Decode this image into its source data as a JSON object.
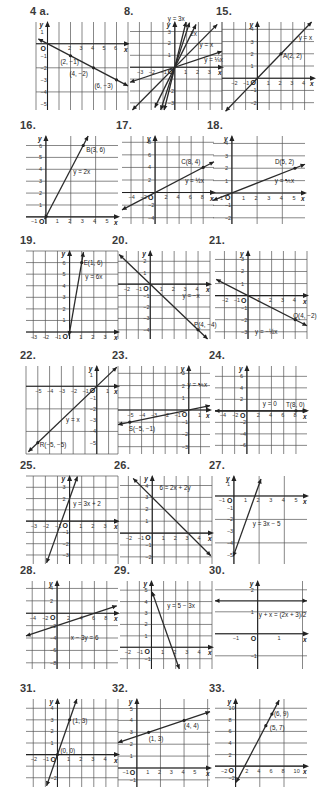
{
  "page": {
    "background": "#ffffff",
    "ink_color": "#2a2a2a"
  },
  "chart_data": [
    {
      "id": "4a",
      "label": "4 a.",
      "type": "line",
      "x_ticks": [
        2,
        3,
        4,
        5,
        6
      ],
      "y_ticks": [
        1,
        -1,
        -2,
        -3,
        -4,
        -5
      ],
      "xlim": [
        -1,
        7
      ],
      "ylim": [
        -5.5,
        1.8
      ],
      "xlabel": "x",
      "ylabel": "y",
      "series": [
        {
          "name": "line",
          "slope": -0.5,
          "intercept": 0,
          "x_range": [
            -0.8,
            7
          ]
        }
      ],
      "points": [
        {
          "x": 2,
          "y": -1,
          "label": "(2, −1)",
          "dx": -10,
          "dy": 8
        },
        {
          "x": 4,
          "y": -2,
          "label": "(4, −2)",
          "dx": -24,
          "dy": 8
        },
        {
          "x": 6,
          "y": -3,
          "label": "(6, −3)",
          "dx": -22,
          "dy": 8
        }
      ],
      "labels": [],
      "pos": [
        36,
        8
      ]
    },
    {
      "id": "8",
      "label": "8.",
      "type": "line",
      "x_ticks": [
        -3,
        -2,
        -1,
        1,
        2,
        3
      ],
      "y_ticks": [
        3,
        2,
        1,
        -2,
        -3
      ],
      "xlim": [
        -3.8,
        4
      ],
      "ylim": [
        -3.6,
        3.8
      ],
      "xlabel": "x",
      "ylabel": "y",
      "series": [
        {
          "name": "y = 3x",
          "slope": 3,
          "intercept": 0,
          "x_range": [
            -1.2,
            1.25
          ]
        },
        {
          "name": "y = 2x",
          "slope": 2,
          "intercept": 0,
          "x_range": [
            -1.7,
            1.8
          ]
        },
        {
          "name": "y = x",
          "slope": 1,
          "intercept": 0,
          "x_range": [
            -3.6,
            3.6
          ]
        },
        {
          "name": "y = 1/3 x",
          "slope": 0.3333,
          "intercept": 0,
          "x_range": [
            -3.8,
            4
          ]
        },
        {
          "name": "y = 4x",
          "slope": 4,
          "intercept": 0,
          "x_range": [
            -0.9,
            0.95
          ]
        }
      ],
      "points": [],
      "labels": [
        {
          "text": "y = 3x",
          "x": -0.6,
          "y": 3.9
        },
        {
          "text": "2x",
          "x": 1.3,
          "y": 2.6
        },
        {
          "text": "y = x",
          "x": 2.1,
          "y": 1.7
        },
        {
          "text": "y = ⅓x",
          "x": 2.5,
          "y": 0.4
        }
      ],
      "pos": [
        130,
        8
      ]
    },
    {
      "id": "15",
      "label": "15.",
      "type": "line",
      "x_ticks": [
        -2,
        -1,
        1,
        2,
        3,
        4
      ],
      "y_ticks": [
        4,
        3,
        2,
        1,
        -1,
        -2
      ],
      "xlim": [
        -3,
        4.8
      ],
      "ylim": [
        -2.6,
        4.6
      ],
      "xlabel": "x",
      "ylabel": "y",
      "series": [
        {
          "name": "y = x",
          "slope": 1,
          "intercept": 0,
          "x_range": [
            -2.7,
            4.6
          ]
        }
      ],
      "points": [
        {
          "x": 2,
          "y": 2,
          "label": "A(2, 2)",
          "dx": 2,
          "dy": 4
        }
      ],
      "labels": [
        {
          "text": "y = x",
          "x": 3.5,
          "y": 3.1
        }
      ],
      "pos": [
        222,
        8
      ]
    },
    {
      "id": "16",
      "label": "16.",
      "type": "line",
      "x_ticks": [
        -1,
        1,
        2,
        3,
        4,
        5
      ],
      "y_ticks": [
        6,
        5,
        4,
        3,
        2,
        1
      ],
      "xlim": [
        -1.6,
        5.8
      ],
      "ylim": [
        -0.6,
        6.8
      ],
      "xlabel": "x",
      "ylabel": "y",
      "series": [
        {
          "name": "y = 2x",
          "slope": 2,
          "intercept": 0,
          "x_range": [
            -0.1,
            3.4
          ]
        }
      ],
      "points": [
        {
          "x": 3,
          "y": 6,
          "label": "B(3, 6)",
          "dx": 3,
          "dy": 6
        }
      ],
      "labels": [
        {
          "text": "y = 2x",
          "x": 2.2,
          "y": 3.6
        }
      ],
      "pos": [
        26,
        122
      ]
    },
    {
      "id": "17",
      "label": "17.",
      "type": "line",
      "x_ticks": [
        -4,
        -2,
        2,
        4,
        6,
        8
      ],
      "y_ticks": [
        8,
        6,
        4,
        2,
        -2,
        -4
      ],
      "xlim": [
        -5.5,
        9.8
      ],
      "ylim": [
        -5,
        9
      ],
      "xlabel": "x",
      "ylabel": "y",
      "series": [
        {
          "name": "y = 1/2 x",
          "slope": 0.5,
          "intercept": 0,
          "x_range": [
            -5.5,
            9.8
          ]
        }
      ],
      "points": [
        {
          "x": 8,
          "y": 4,
          "label": "C(8, 4)",
          "dx": -22,
          "dy": -3
        }
      ],
      "labels": [
        {
          "text": "y = ½x",
          "x": 5,
          "y": 1.6
        }
      ],
      "pos": [
        122,
        122
      ]
    },
    {
      "id": "18",
      "label": "18.",
      "type": "line",
      "x_ticks": [
        -1,
        1,
        2,
        3,
        4,
        5
      ],
      "y_ticks": [
        4,
        3,
        2,
        1,
        -1,
        -2
      ],
      "xlim": [
        -1.5,
        5.8
      ],
      "ylim": [
        -2.5,
        4.6
      ],
      "xlabel": "x",
      "ylabel": "y",
      "series": [
        {
          "name": "y = 2/5 x",
          "slope": 0.4,
          "intercept": 0,
          "x_range": [
            -1.5,
            5.8
          ]
        }
      ],
      "points": [
        {
          "x": 5,
          "y": 2,
          "label": "D(5, 2)",
          "dx": -20,
          "dy": -4
        }
      ],
      "labels": [
        {
          "text": "y = ⅖x",
          "x": 3.4,
          "y": 0.8
        }
      ],
      "pos": [
        213,
        122
      ]
    },
    {
      "id": "19",
      "label": "19.",
      "type": "line",
      "x_ticks": [
        -3,
        -2,
        -1,
        1,
        2,
        3
      ],
      "y_ticks": [
        6,
        5,
        4,
        3,
        2,
        1
      ],
      "xlim": [
        -3.6,
        4
      ],
      "ylim": [
        -0.6,
        7
      ],
      "xlabel": "x",
      "ylabel": "y",
      "series": [
        {
          "name": "y = 6x",
          "slope": 6,
          "intercept": 0,
          "x_range": [
            -0.05,
            1.15
          ]
        }
      ],
      "points": [
        {
          "x": 1,
          "y": 6,
          "label": "E(1, 6)",
          "dx": 2,
          "dy": 2
        }
      ],
      "labels": [
        {
          "text": "y = 6x",
          "x": 1.3,
          "y": 4.6
        }
      ],
      "pos": [
        26,
        237
      ]
    },
    {
      "id": "20",
      "label": "20.",
      "type": "line",
      "x_ticks": [
        -2,
        -1,
        1,
        2,
        3,
        4
      ],
      "y_ticks": [
        2,
        1,
        -1,
        -2,
        -3,
        -4
      ],
      "xlim": [
        -2.7,
        5
      ],
      "ylim": [
        -4.8,
        2.9
      ],
      "xlabel": "x",
      "ylabel": "y",
      "series": [
        {
          "name": "y = −x",
          "slope": -1,
          "intercept": 0,
          "x_range": [
            -2.6,
            4.8
          ]
        }
      ],
      "points": [
        {
          "x": 4,
          "y": -4,
          "label": "P(4, −4)",
          "dx": -4,
          "dy": -3
        }
      ],
      "labels": [
        {
          "text": "y = −x",
          "x": 2.7,
          "y": -1.2
        }
      ],
      "pos": [
        118,
        237
      ]
    },
    {
      "id": "21",
      "label": "21.",
      "type": "line",
      "x_ticks": [
        -2,
        -1,
        1,
        2,
        3,
        4
      ],
      "y_ticks": [
        3,
        2,
        1,
        -1,
        -2,
        -3
      ],
      "xlim": [
        -2.8,
        5
      ],
      "ylim": [
        -3.6,
        3.7
      ],
      "xlabel": "x",
      "ylabel": "y",
      "series": [
        {
          "name": "y = −1/2 x",
          "slope": -0.5,
          "intercept": 0,
          "x_range": [
            -2.7,
            5
          ]
        }
      ],
      "points": [
        {
          "x": 4,
          "y": -2,
          "label": "Q(4, −2)",
          "dx": -2,
          "dy": -2
        }
      ],
      "labels": [
        {
          "text": "y = −½x",
          "x": 0.6,
          "y": -3.2
        }
      ],
      "pos": [
        215,
        237
      ]
    },
    {
      "id": "22",
      "label": "22.",
      "type": "line",
      "x_ticks": [
        -5,
        -4,
        -3,
        -2,
        -1,
        1
      ],
      "y_ticks": [
        1,
        -1,
        -2,
        -3,
        -4,
        -5
      ],
      "xlim": [
        -6,
        1.8
      ],
      "ylim": [
        -6,
        1.8
      ],
      "xlabel": "x",
      "ylabel": "y",
      "series": [
        {
          "name": "y = x",
          "slope": 1,
          "intercept": 0,
          "x_range": [
            -5.8,
            1.7
          ]
        }
      ],
      "points": [
        {
          "x": -5,
          "y": -5,
          "label": "R(−5, −5)",
          "dx": 2,
          "dy": 4
        }
      ],
      "labels": [
        {
          "text": "y = x",
          "x": -2.6,
          "y": -3.2
        }
      ],
      "pos": [
        26,
        352
      ]
    },
    {
      "id": "23",
      "label": "23.",
      "type": "line",
      "x_ticks": [
        -5,
        -4,
        -3,
        -2,
        -1,
        1
      ],
      "y_ticks": [
        3,
        2,
        1,
        -1,
        -2,
        -3
      ],
      "xlim": [
        -6,
        1.8
      ],
      "ylim": [
        -3.6,
        3.6
      ],
      "xlabel": "x",
      "ylabel": "y",
      "series": [
        {
          "name": "y = 1/5 x",
          "slope": 0.2,
          "intercept": 0,
          "x_range": [
            -6,
            1.8
          ]
        }
      ],
      "points": [
        {
          "x": -5,
          "y": -1,
          "label": "S(−5, −1)",
          "dx": -1,
          "dy": 9
        }
      ],
      "labels": [
        {
          "text": "y = ⅕x",
          "x": -0.1,
          "y": 1.9
        }
      ],
      "pos": [
        118,
        352
      ]
    },
    {
      "id": "24",
      "label": "24.",
      "type": "line",
      "x_ticks": [
        -4,
        -2,
        2,
        4,
        6,
        8
      ],
      "y_ticks": [
        6,
        4,
        2,
        -2,
        -4,
        -6
      ],
      "xlim": [
        -5.2,
        9.8
      ],
      "ylim": [
        -7.5,
        7.8
      ],
      "xlabel": "x",
      "ylabel": "y",
      "series": [
        {
          "name": "y = 0",
          "slope": 0,
          "intercept": 0,
          "x_range": [
            -5.2,
            9.8
          ]
        }
      ],
      "points": [
        {
          "x": 8,
          "y": 0,
          "label": "T(8, 0)",
          "dx": -10,
          "dy": -4
        }
      ],
      "labels": [
        {
          "text": "y = 0",
          "x": 2.6,
          "y": 0.9
        }
      ],
      "pos": [
        215,
        352
      ]
    },
    {
      "id": "25",
      "label": "25.",
      "type": "line",
      "x_ticks": [
        -3,
        -2,
        -1,
        1,
        2,
        3
      ],
      "y_ticks": [
        3,
        2,
        -1,
        -2,
        -3
      ],
      "xlim": [
        -3.6,
        4
      ],
      "ylim": [
        -3.8,
        4
      ],
      "xlabel": "x",
      "ylabel": "y",
      "series": [
        {
          "name": "y = 3x + 2",
          "slope": 3,
          "intercept": 2,
          "x_range": [
            -1.9,
            0.65
          ]
        }
      ],
      "points": [],
      "labels": [
        {
          "text": "y = 3x + 2",
          "x": 0.3,
          "y": 1.3
        }
      ],
      "pos": [
        26,
        462
      ]
    },
    {
      "id": "26",
      "label": "26.",
      "type": "line",
      "x_ticks": [
        -2,
        -1,
        1,
        2,
        3,
        4
      ],
      "y_ticks": [
        4,
        3,
        2,
        1,
        -1,
        -2
      ],
      "xlim": [
        -2.7,
        5
      ],
      "ylim": [
        -2.6,
        4.8
      ],
      "xlabel": "x",
      "ylabel": "y",
      "series": [
        {
          "name": "6 = 2x + 2y",
          "slope": -1,
          "intercept": 3,
          "x_range": [
            -1.6,
            4.9
          ]
        }
      ],
      "points": [],
      "labels": [
        {
          "text": "6 = 2x + 2y",
          "x": 0.6,
          "y": 3.6
        }
      ],
      "pos": [
        120,
        462
      ]
    },
    {
      "id": "27",
      "label": "27.",
      "type": "line",
      "x_ticks": [
        -1,
        1,
        2,
        3,
        4,
        5
      ],
      "y_ticks": [
        1,
        -1,
        -2,
        -3,
        -4,
        -5
      ],
      "xlim": [
        -1.5,
        5.8
      ],
      "ylim": [
        -5.8,
        1.7
      ],
      "xlabel": "x",
      "ylabel": "y",
      "series": [
        {
          "name": "y = 3x − 5",
          "slope": 3,
          "intercept": -5,
          "x_range": [
            -0.05,
            2.15
          ]
        }
      ],
      "points": [],
      "labels": [
        {
          "text": "y = 3x − 5",
          "x": 1.5,
          "y": -2.6
        }
      ],
      "pos": [
        215,
        462
      ]
    },
    {
      "id": "28",
      "label": "28.",
      "type": "line",
      "x_ticks": [
        -4,
        -2,
        2,
        4,
        6,
        8
      ],
      "y_ticks": [
        4,
        2,
        -2,
        -4,
        -6,
        -8
      ],
      "xlim": [
        -5,
        9.8
      ],
      "ylim": [
        -9,
        5.2
      ],
      "xlabel": "x",
      "ylabel": "y",
      "series": [
        {
          "name": "x − 3y = 6",
          "slope": 0.3333,
          "intercept": -2,
          "x_range": [
            -5,
            9.6
          ]
        }
      ],
      "points": [],
      "labels": [
        {
          "text": "x − 3y = 6",
          "x": 2.2,
          "y": -4.4
        }
      ],
      "pos": [
        26,
        567
      ]
    },
    {
      "id": "29",
      "label": "29.",
      "type": "line",
      "x_ticks": [
        -2,
        -1,
        1,
        2,
        3,
        4
      ],
      "y_ticks": [
        5,
        4,
        3,
        2,
        1,
        -1
      ],
      "xlim": [
        -2.6,
        5
      ],
      "ylim": [
        -1.9,
        5.8
      ],
      "xlabel": "x",
      "ylabel": "y",
      "series": [
        {
          "name": "y = 5 − 3x",
          "slope": -3,
          "intercept": 5,
          "x_range": [
            0.05,
            2.3
          ]
        }
      ],
      "points": [],
      "labels": [
        {
          "text": "y = 5 − 3x",
          "x": 1.3,
          "y": 3.4
        }
      ],
      "pos": [
        120,
        567
      ]
    },
    {
      "id": "30",
      "label": "30.",
      "type": "line",
      "x_ticks": [
        -1,
        1
      ],
      "y_ticks": [
        2,
        1,
        -1
      ],
      "xlim": [
        -1.9,
        2.2
      ],
      "ylim": [
        -1.6,
        2.4
      ],
      "xlabel": "x",
      "ylabel": "y",
      "series": [
        {
          "name": "y + x = (2x + 3)/2",
          "slope": 0,
          "intercept": 1.5,
          "x_range": [
            -1.9,
            2.2
          ]
        }
      ],
      "points": [],
      "labels": [
        {
          "text": "y + x = (2x + 3)/2",
          "x": 0.05,
          "y": 0.78
        }
      ],
      "pos": [
        215,
        567
      ]
    },
    {
      "id": "31",
      "label": "31.",
      "type": "line",
      "x_ticks": [
        -2,
        -1,
        1,
        2,
        3,
        4
      ],
      "y_ticks": [
        4,
        3,
        2,
        1,
        -2
      ],
      "xlim": [
        -2.6,
        5
      ],
      "ylim": [
        -2.8,
        4.8
      ],
      "xlabel": "x",
      "ylabel": "y",
      "series": [
        {
          "name": "y = 3x",
          "slope": 3,
          "intercept": 0,
          "x_range": [
            -0.9,
            1.6
          ]
        }
      ],
      "points": [
        {
          "x": 1,
          "y": 3,
          "label": "(1, 3)",
          "dx": 3,
          "dy": 3
        },
        {
          "x": 0,
          "y": 0,
          "label": "(0, 0)",
          "dx": 3,
          "dy": -2
        }
      ],
      "labels": [],
      "pos": [
        26,
        685
      ]
    },
    {
      "id": "32",
      "label": "32.",
      "type": "line",
      "x_ticks": [
        -1,
        1,
        2,
        3,
        4,
        5
      ],
      "y_ticks": [
        5,
        4,
        3,
        2,
        1,
        -1
      ],
      "xlim": [
        -1.6,
        6.2
      ],
      "ylim": [
        -1.6,
        5.8
      ],
      "xlabel": "x",
      "ylabel": "y",
      "series": [
        {
          "name": "y = 1/3 x + 8/3",
          "slope": 0.3333,
          "intercept": 2.6667,
          "x_range": [
            -1.6,
            6.2
          ]
        }
      ],
      "points": [
        {
          "x": 1,
          "y": 3,
          "label": "(1, 3)",
          "dx": 0,
          "dy": 9
        },
        {
          "x": 4,
          "y": 4,
          "label": "(4, 4)",
          "dx": 0,
          "dy": 8
        }
      ],
      "labels": [],
      "pos": [
        118,
        685
      ]
    },
    {
      "id": "33",
      "label": "33.",
      "type": "line",
      "x_ticks": [
        -2,
        2,
        4,
        6,
        8,
        10
      ],
      "y_ticks": [
        10,
        8,
        6,
        4,
        2,
        -2
      ],
      "xlim": [
        -3.4,
        11.8
      ],
      "ylim": [
        -3.6,
        11.6
      ],
      "xlabel": "x",
      "ylabel": "y",
      "series": [
        {
          "name": "y = 2x − 3",
          "slope": 2,
          "intercept": -3,
          "x_range": [
            0.1,
            7.2
          ]
        }
      ],
      "points": [
        {
          "x": 6,
          "y": 9,
          "label": "(6, 9)",
          "dx": 2,
          "dy": 2
        },
        {
          "x": 5,
          "y": 7,
          "label": "(5, 7)",
          "dx": 4,
          "dy": 4
        }
      ],
      "labels": [],
      "pos": [
        215,
        685
      ]
    }
  ]
}
